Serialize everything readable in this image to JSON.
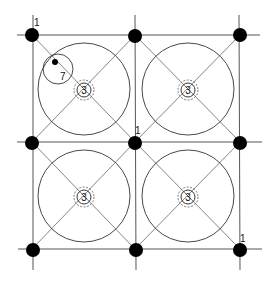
{
  "diagram": {
    "columns": {
      "xs": [
        32,
        135,
        240
      ],
      "ys": [
        35,
        142,
        249
      ],
      "dot_radius": 7,
      "color": "#000000"
    },
    "bays": [
      {
        "id": "bay-top-left",
        "center_label": "3"
      },
      {
        "id": "bay-top-right",
        "center_label": "3"
      },
      {
        "id": "bay-bottom-left",
        "center_label": "3"
      },
      {
        "id": "bay-bottom-right",
        "center_label": "3"
      }
    ],
    "labels": {
      "column_top_left": "1",
      "column_center": "1",
      "column_bottom_right": "1",
      "detail_circle": "7"
    },
    "line_color": "#555555"
  }
}
